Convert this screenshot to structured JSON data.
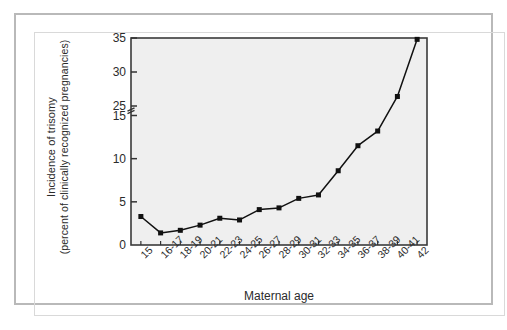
{
  "chart_data": {
    "type": "line",
    "title": "",
    "subtitle": "",
    "xlabel": "Maternal age",
    "ylabel_line1": "Incidence of trisomy",
    "ylabel_line2": "(percent of clinically recognized pregnancies)",
    "categories": [
      "15",
      "16-17",
      "18-19",
      "20-21",
      "22-23",
      "24-25",
      "26-27",
      "28-29",
      "30-31",
      "32-33",
      "34-35",
      "36-37",
      "38-39",
      "40-41",
      "42"
    ],
    "values": [
      3.3,
      1.4,
      1.7,
      2.3,
      3.1,
      2.9,
      4.1,
      4.3,
      5.4,
      5.8,
      8.6,
      11.5,
      13.2,
      26.4,
      34.8
    ],
    "y_tick_labels": [
      "0",
      "5",
      "10",
      "15",
      "25",
      "30",
      "35"
    ],
    "y_tick_values": [
      0,
      5,
      10,
      15,
      25,
      30,
      35
    ],
    "axis_break": {
      "present": true,
      "between": [
        15,
        25
      ]
    },
    "ylim": [
      0,
      35
    ],
    "grid": false,
    "legend": "none",
    "marker": "filled-square",
    "line_color": "#111111",
    "marker_color": "#111111",
    "plot_background": "#efefef",
    "axis_color": "#333333",
    "series_name": "Incidence of trisomy"
  },
  "figure": {
    "frame_color": "#b9b9b9",
    "page_background": "#ffffff"
  }
}
